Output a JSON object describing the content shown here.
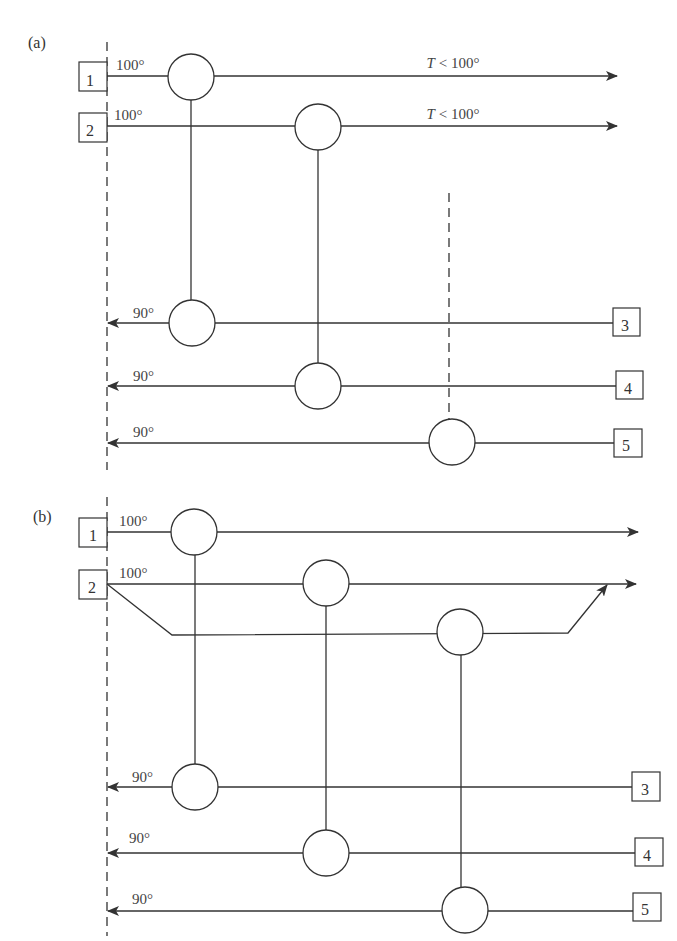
{
  "panels": [
    {
      "id": "a",
      "label": "(a)",
      "streams": {
        "hot": [
          {
            "id": "1",
            "inlet_temp": "100°",
            "outlet_label": "T < 100°"
          },
          {
            "id": "2",
            "inlet_temp": "100°",
            "outlet_label": "T < 100°"
          }
        ],
        "cold": [
          {
            "id": "3",
            "outlet_temp": "90°"
          },
          {
            "id": "4",
            "outlet_temp": "90°"
          },
          {
            "id": "5",
            "outlet_temp": "90°"
          }
        ]
      },
      "matches": [
        {
          "hot": "1",
          "cold": "3"
        },
        {
          "hot": "2",
          "cold": "4"
        },
        {
          "hot": null,
          "cold": "5",
          "note": "dashed connection (external)"
        }
      ]
    },
    {
      "id": "b",
      "label": "(b)",
      "streams": {
        "hot": [
          {
            "id": "1",
            "inlet_temp": "100°"
          },
          {
            "id": "2",
            "inlet_temp": "100°",
            "split": true
          }
        ],
        "cold": [
          {
            "id": "3",
            "outlet_temp": "90°"
          },
          {
            "id": "4",
            "outlet_temp": "90°"
          },
          {
            "id": "5",
            "outlet_temp": "90°"
          }
        ]
      },
      "matches": [
        {
          "hot": "1",
          "cold": "3"
        },
        {
          "hot": "2",
          "cold": "4"
        },
        {
          "hot": "2 (branch)",
          "cold": "5"
        }
      ]
    }
  ],
  "text": {
    "a_label": "(a)",
    "b_label": "(b)",
    "t100": "100°",
    "t90": "90°",
    "tlt": "T < 100°",
    "s1": "1",
    "s2": "2",
    "s3": "3",
    "s4": "4",
    "s5": "5"
  }
}
